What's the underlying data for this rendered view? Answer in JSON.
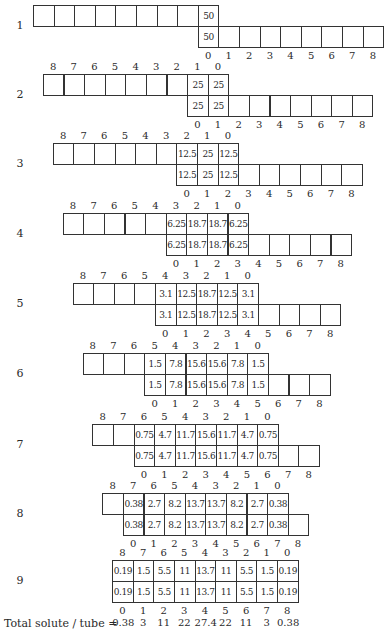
{
  "diagram": {
    "cell_count": 9,
    "rows": [
      {
        "label": "1",
        "values": [
          "50"
        ]
      },
      {
        "label": "2",
        "values": [
          "25",
          "25"
        ]
      },
      {
        "label": "3",
        "values": [
          "12.5",
          "25",
          "12.5"
        ]
      },
      {
        "label": "4",
        "values": [
          "6.25",
          "18.7",
          "18.7",
          "6.25"
        ]
      },
      {
        "label": "5",
        "values": [
          "3.1",
          "12.5",
          "18.7",
          "12.5",
          "3.1"
        ]
      },
      {
        "label": "6",
        "values": [
          "1.5",
          "7.8",
          "15.6",
          "15.6",
          "7.8",
          "1.5"
        ]
      },
      {
        "label": "7",
        "values": [
          "0.75",
          "4.7",
          "11.7",
          "15.6",
          "11.7",
          "4.7",
          "0.75"
        ]
      },
      {
        "label": "8",
        "values": [
          "0.38",
          "2.7",
          "8.2",
          "13.7",
          "13.7",
          "8.2",
          "2.7",
          "0.38"
        ]
      },
      {
        "label": "9",
        "values": [
          "0.19",
          "1.5",
          "5.5",
          "11",
          "13.7",
          "11",
          "5.5",
          "1.5",
          "0.19"
        ]
      }
    ],
    "top_index_labels": [
      "8",
      "7",
      "6",
      "5",
      "4",
      "3",
      "2",
      "1",
      "0"
    ],
    "bottom_index_labels": [
      "0",
      "1",
      "2",
      "3",
      "4",
      "5",
      "6",
      "7",
      "8"
    ],
    "totals": {
      "label": "Total solute / tube  =",
      "values": [
        "0.38",
        "3",
        "11",
        "22",
        "27.4",
        "22",
        "11",
        "3",
        "0.38"
      ]
    }
  }
}
